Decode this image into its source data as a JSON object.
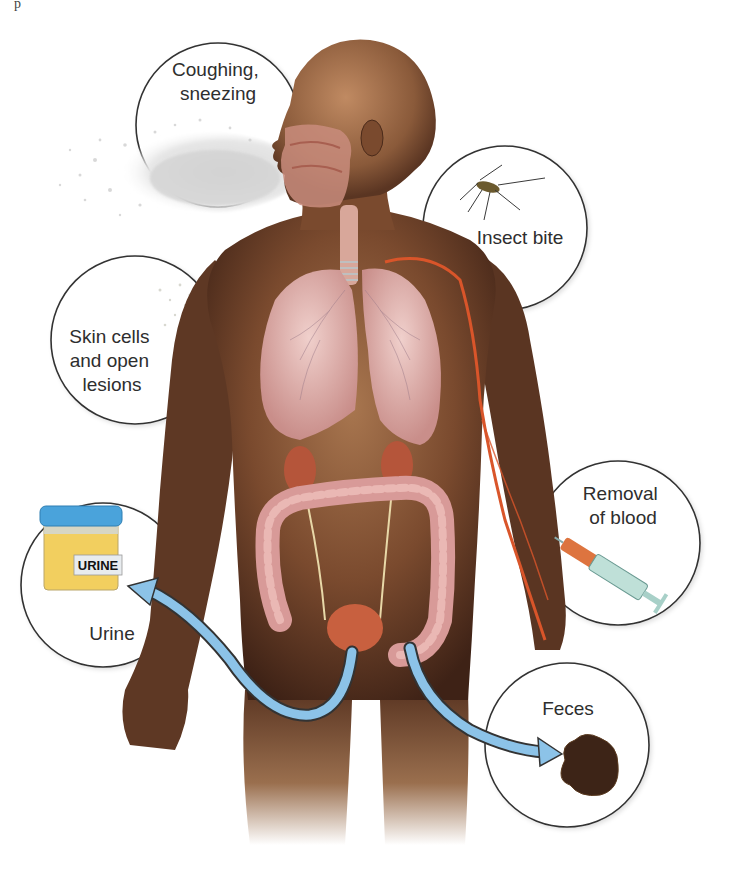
{
  "figure": {
    "topic": "Portals of exit from the human body",
    "corner_fragment": "p"
  },
  "callouts": [
    {
      "id": "coughing",
      "lines": [
        "Coughing,",
        "sneezing"
      ]
    },
    {
      "id": "insect",
      "lines": [
        "Insect bite"
      ]
    },
    {
      "id": "skin",
      "lines": [
        "Skin cells",
        "and open",
        "lesions"
      ]
    },
    {
      "id": "blood",
      "lines": [
        "Removal",
        "of blood"
      ]
    },
    {
      "id": "urine",
      "lines": [
        "Urine"
      ],
      "container_label": "URINE"
    },
    {
      "id": "feces",
      "lines": [
        "Feces"
      ]
    }
  ],
  "colors": {
    "skin_dark": "#4a2a1a",
    "skin_mid": "#8a5a3a",
    "skin_light": "#b7865e",
    "organ_pink": "#d9a3a0",
    "kidney_red": "#b5553a",
    "vein_orange": "#d9552a",
    "arrow_blue": "#8cc3e8",
    "jar_lid_blue": "#4aa3db",
    "urine_yellow": "#f2cf5f",
    "feces_brown": "#3d2417",
    "circle_stroke": "#333333"
  }
}
